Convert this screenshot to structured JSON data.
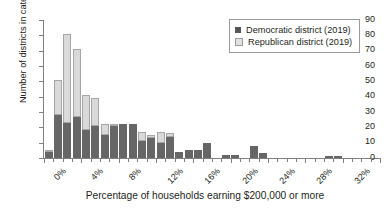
{
  "chart_data": {
    "type": "bar",
    "subtype": "stacked-histogram",
    "title": "",
    "xlabel": "Percentage of households earning $200,000 or more",
    "ylabel": "Number of districts in category",
    "xlim": [
      0,
      36
    ],
    "ylim": [
      0,
      90
    ],
    "ytick_step": 10,
    "yticks": [
      0,
      10,
      20,
      30,
      40,
      50,
      60,
      70,
      80,
      90
    ],
    "xticks": [
      0,
      1,
      2,
      3,
      4,
      5,
      6,
      7,
      8,
      9,
      10,
      11,
      12,
      13,
      14,
      15,
      16,
      17,
      18,
      19,
      20,
      21,
      22,
      23,
      24,
      25,
      26,
      27,
      28,
      29,
      30,
      31,
      32,
      33,
      34,
      35,
      36
    ],
    "xtick_labels_major": [
      "0%",
      "4%",
      "8%",
      "12%",
      "16%",
      "20%",
      "24%",
      "28%",
      "32%",
      "36%"
    ],
    "xtick_major_values": [
      0,
      4,
      8,
      12,
      16,
      20,
      24,
      28,
      32,
      36
    ],
    "bin_width": 1,
    "grid": false,
    "legend_position": "top-right",
    "categories": [
      "0",
      "1",
      "2",
      "3",
      "4",
      "5",
      "6",
      "7",
      "8",
      "9",
      "10",
      "11",
      "12",
      "13",
      "14",
      "15",
      "16",
      "17",
      "18",
      "19",
      "20",
      "21",
      "22",
      "23",
      "24",
      "25",
      "26",
      "27",
      "28",
      "29",
      "30",
      "31",
      "32",
      "33",
      "34",
      "35"
    ],
    "series": [
      {
        "name": "Democratic district (2019)",
        "color": "#666666",
        "values": [
          4,
          28,
          23,
          27,
          18,
          21,
          15,
          21,
          22,
          22,
          11,
          13,
          10,
          14,
          4,
          5,
          5,
          10,
          0,
          2,
          2,
          0,
          8,
          3,
          0,
          0,
          0,
          0,
          0,
          0,
          1,
          1,
          0,
          0,
          0,
          0
        ]
      },
      {
        "name": "Republican district (2019)",
        "color": "#d9d9d9",
        "values": [
          1,
          23,
          58,
          44,
          23,
          18,
          7,
          1,
          0,
          0,
          6,
          2,
          7,
          2,
          0,
          0,
          0,
          0,
          0,
          0,
          0,
          0,
          0,
          0,
          0,
          0,
          0,
          0,
          0,
          0,
          0,
          0,
          0,
          0,
          0,
          0
        ]
      }
    ],
    "totals": [
      5,
      51,
      81,
      71,
      41,
      39,
      22,
      22,
      22,
      22,
      17,
      15,
      17,
      16,
      4,
      5,
      5,
      10,
      0,
      2,
      2,
      0,
      8,
      3,
      0,
      0,
      0,
      0,
      0,
      0,
      1,
      1,
      0,
      0,
      0,
      0
    ]
  },
  "legend": {
    "items": [
      {
        "label": "Democratic district (2019)",
        "swatch": "dem"
      },
      {
        "label": "Republican district (2019)",
        "swatch": "rep"
      }
    ]
  }
}
